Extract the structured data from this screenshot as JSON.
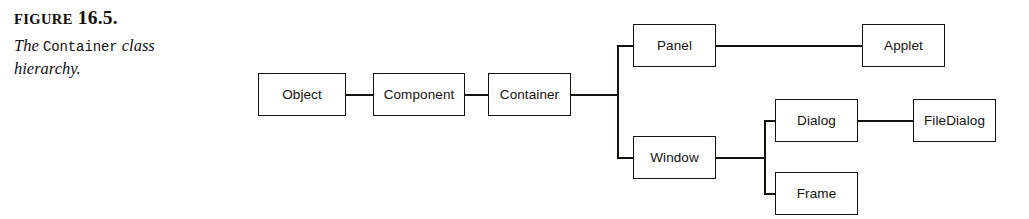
{
  "figure": {
    "heading_label": "FIGURE",
    "heading_number": "16.5.",
    "caption_part1": "The",
    "caption_code": "Container",
    "caption_part2": "class",
    "caption_line2": "hierarchy."
  },
  "diagram": {
    "type": "class-hierarchy-tree",
    "line_color": "#15110f",
    "background": "#ffffff",
    "nodes": [
      {
        "id": "object",
        "label": "Object",
        "x": 258,
        "y": 73,
        "w": 88,
        "h": 43
      },
      {
        "id": "component",
        "label": "Component",
        "x": 373,
        "y": 73,
        "w": 92,
        "h": 43
      },
      {
        "id": "container",
        "label": "Container",
        "x": 488,
        "y": 73,
        "w": 83,
        "h": 43
      },
      {
        "id": "panel",
        "label": "Panel",
        "x": 633,
        "y": 24,
        "w": 83,
        "h": 43
      },
      {
        "id": "applet",
        "label": "Applet",
        "x": 862,
        "y": 24,
        "w": 83,
        "h": 43
      },
      {
        "id": "window",
        "label": "Window",
        "x": 633,
        "y": 136,
        "w": 83,
        "h": 43
      },
      {
        "id": "dialog",
        "label": "Dialog",
        "x": 775,
        "y": 99,
        "w": 83,
        "h": 43
      },
      {
        "id": "filedialog",
        "label": "FileDialog",
        "x": 913,
        "y": 99,
        "w": 83,
        "h": 43
      },
      {
        "id": "frame",
        "label": "Frame",
        "x": 775,
        "y": 172,
        "w": 83,
        "h": 43
      }
    ],
    "edges": [
      {
        "id": "object-component",
        "orient": "h",
        "x": 346,
        "y": 94,
        "len": 27
      },
      {
        "id": "component-container",
        "orient": "h",
        "x": 465,
        "y": 94,
        "len": 23
      },
      {
        "id": "container-trunk",
        "orient": "h",
        "x": 571,
        "y": 94,
        "len": 48
      },
      {
        "id": "trunk-container",
        "orient": "v",
        "x": 617,
        "y": 45,
        "len": 113
      },
      {
        "id": "trunk-panel",
        "orient": "h",
        "x": 617,
        "y": 45,
        "len": 16
      },
      {
        "id": "trunk-window",
        "orient": "h",
        "x": 617,
        "y": 157,
        "len": 16
      },
      {
        "id": "panel-applet",
        "orient": "h",
        "x": 716,
        "y": 45,
        "len": 146
      },
      {
        "id": "window-trunk2",
        "orient": "h",
        "x": 716,
        "y": 157,
        "len": 49
      },
      {
        "id": "trunk-window-children",
        "orient": "v",
        "x": 764,
        "y": 120,
        "len": 74
      },
      {
        "id": "trunk2-dialog",
        "orient": "h",
        "x": 764,
        "y": 120,
        "len": 11
      },
      {
        "id": "trunk2-frame",
        "orient": "h",
        "x": 764,
        "y": 193,
        "len": 11
      },
      {
        "id": "dialog-filedialog",
        "orient": "h",
        "x": 858,
        "y": 120,
        "len": 55
      }
    ]
  }
}
